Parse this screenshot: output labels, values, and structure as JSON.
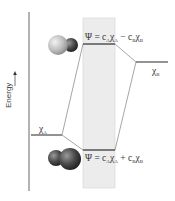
{
  "diagram": {
    "axis": {
      "label": "Energy",
      "arrow_direction": "up"
    },
    "atomic_orbitals": {
      "a": {
        "symbol": "χ",
        "subscript": "A"
      },
      "b": {
        "symbol": "χ",
        "subscript": "B"
      }
    },
    "molecular_orbitals": {
      "antibonding": {
        "prefix": "Ψ = c",
        "c1_sub": "A",
        "chi1": "χ",
        "chi1_sub": "A",
        "op": " − c",
        "c2_sub": "B",
        "chi2": "χ",
        "chi2_sub": "B"
      },
      "bonding": {
        "prefix": "Ψ = c",
        "c1_sub": "A",
        "chi1": "χ",
        "chi1_sub": "A",
        "op": " + c",
        "c2_sub": "B",
        "chi2": "χ",
        "chi2_sub": "B"
      }
    },
    "colors": {
      "level_line": "#4a4a4a",
      "connector": "#6a6a6a",
      "axis": "#555555",
      "mo_band": "#ececec",
      "mo_band_border": "#d4d4d4"
    }
  }
}
